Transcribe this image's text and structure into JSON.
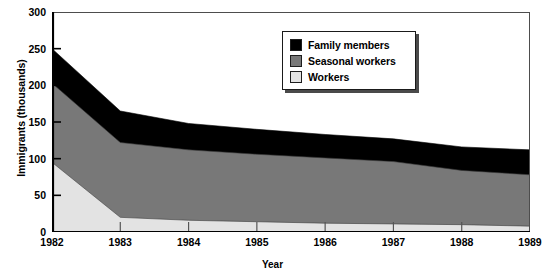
{
  "chart_data": {
    "type": "area",
    "stacked": true,
    "title": "",
    "xlabel": "Year",
    "ylabel": "Immigrants (thousands)",
    "categories": [
      "1982",
      "1983",
      "1984",
      "1985",
      "1986",
      "1987",
      "1988",
      "1989"
    ],
    "x": [
      1982,
      1983,
      1984,
      1985,
      1986,
      1987,
      1988,
      1989
    ],
    "xlim": [
      1982,
      1989
    ],
    "ylim": [
      0,
      300
    ],
    "yticks": [
      0,
      50,
      100,
      150,
      200,
      250,
      300
    ],
    "xticks": [
      "1982",
      "1983",
      "1984",
      "1985",
      "1986",
      "1987",
      "1988",
      "1989"
    ],
    "grid": false,
    "legend_position": "top-right",
    "series": [
      {
        "name": "Workers",
        "color": "#e3e3e3",
        "values": [
          95,
          20,
          16,
          14,
          12,
          11,
          10,
          8
        ],
        "stack_order": 1
      },
      {
        "name": "Seasonal workers",
        "color": "#787878",
        "values": [
          108,
          102,
          96,
          92,
          89,
          85,
          74,
          70
        ],
        "stack_order": 2,
        "cumulative_top": [
          203,
          122,
          112,
          106,
          101,
          96,
          84,
          78
        ]
      },
      {
        "name": "Family members",
        "color": "#000000",
        "values": [
          47,
          43,
          36,
          34,
          32,
          31,
          32,
          34
        ],
        "stack_order": 3,
        "cumulative_top": [
          250,
          165,
          148,
          140,
          133,
          127,
          116,
          112
        ]
      }
    ]
  },
  "legend": {
    "items": [
      {
        "label": "Family members",
        "color": "#000000"
      },
      {
        "label": "Seasonal workers",
        "color": "#787878"
      },
      {
        "label": "Workers",
        "color": "#e3e3e3"
      }
    ]
  },
  "axes": {
    "y_title": "Immigrants (thousands)",
    "x_title": "Year"
  }
}
